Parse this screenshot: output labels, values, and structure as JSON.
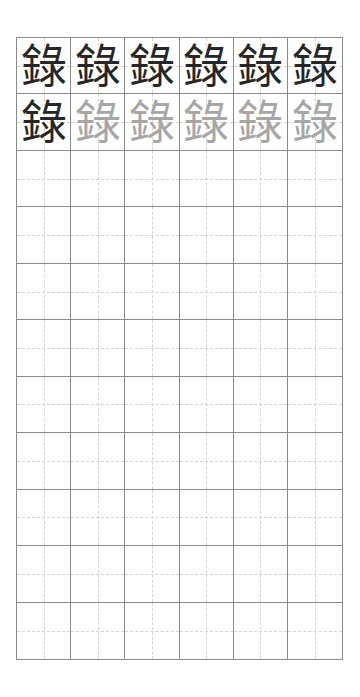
{
  "worksheet": {
    "character": "錄",
    "columns": 6,
    "rows": 11,
    "colors": {
      "grid_line": "#8a8a8a",
      "guide_line": "#d4d4d4",
      "model_glyph": "#262626",
      "trace_glyph": "#a6a6a6"
    },
    "grid": [
      [
        {
          "text": "錄",
          "style": "dark"
        },
        {
          "text": "錄",
          "style": "dark"
        },
        {
          "text": "錄",
          "style": "dark"
        },
        {
          "text": "錄",
          "style": "dark"
        },
        {
          "text": "錄",
          "style": "dark"
        },
        {
          "text": "錄",
          "style": "dark"
        }
      ],
      [
        {
          "text": "錄",
          "style": "dark"
        },
        {
          "text": "錄",
          "style": "trace"
        },
        {
          "text": "錄",
          "style": "trace"
        },
        {
          "text": "錄",
          "style": "trace"
        },
        {
          "text": "錄",
          "style": "trace"
        },
        {
          "text": "錄",
          "style": "trace"
        }
      ]
    ]
  }
}
